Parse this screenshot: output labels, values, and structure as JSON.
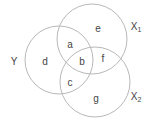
{
  "diagram": {
    "type": "venn",
    "sets": [
      {
        "name": "Y",
        "label": "Y",
        "subscript": ""
      },
      {
        "name": "X1",
        "label": "X",
        "subscript": "1"
      },
      {
        "name": "X2",
        "label": "X",
        "subscript": "2"
      }
    ],
    "regions": {
      "a": "a",
      "b": "b",
      "c": "c",
      "d": "d",
      "e": "e",
      "f": "f",
      "g": "g"
    },
    "colors": {
      "stroke": "#b8b8b8",
      "text": "#444444",
      "background": "#ffffff"
    }
  }
}
